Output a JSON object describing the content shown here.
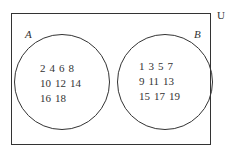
{
  "diagram": {
    "type": "venn",
    "universe_label": "U",
    "sets": [
      {
        "name": "A",
        "elements": [
          [
            2,
            4,
            6,
            8
          ],
          [
            10,
            12,
            14
          ],
          [
            16,
            18
          ]
        ]
      },
      {
        "name": "B",
        "elements": [
          [
            1,
            3,
            5,
            7
          ],
          [
            9,
            11,
            13
          ],
          [
            15,
            17,
            19
          ]
        ]
      }
    ],
    "intersection": []
  }
}
